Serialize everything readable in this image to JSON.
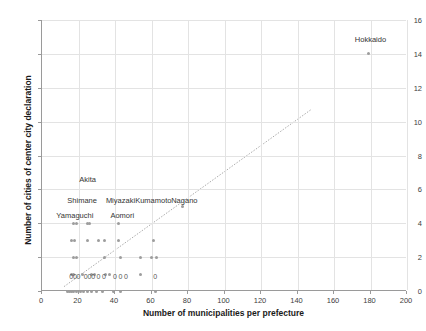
{
  "chart_data": {
    "type": "scatter",
    "title": "",
    "xlabel": "Number of municipalities per prefecture",
    "ylabel": "Number of cities of center city declaration",
    "xlim": [
      0,
      200
    ],
    "ylim": [
      0,
      16
    ],
    "xticks": [
      0,
      20,
      40,
      60,
      80,
      100,
      120,
      140,
      160,
      180,
      200
    ],
    "yticks": [
      0,
      2,
      4,
      6,
      8,
      10,
      12,
      14,
      16
    ],
    "grid": true,
    "legend": "none",
    "colors": {
      "marker": "#9d9d9d",
      "grid": "#e3e3e3",
      "axis": "#9a9a9a",
      "trendline": "#aaaaaa",
      "text": "#333333"
    },
    "trendline": {
      "type": "linear",
      "x_start": 12,
      "y_start": 0.2,
      "x_end": 148,
      "y_end": 10.7
    },
    "annotations": [
      {
        "text": "Hokkaido",
        "x": 180,
        "y": 14.9
      },
      {
        "text": "Akita",
        "x": 25,
        "y": 6.6
      },
      {
        "text": "Shimane",
        "x": 22,
        "y": 5.4
      },
      {
        "text": "Miyazaki",
        "x": 43,
        "y": 5.4
      },
      {
        "text": "Kumamoto",
        "x": 61,
        "y": 5.4
      },
      {
        "text": "Nagano",
        "x": 78,
        "y": 5.4
      },
      {
        "text": "Yamaguchi",
        "x": 18,
        "y": 4.5
      },
      {
        "text": "Aomori",
        "x": 44,
        "y": 4.5
      }
    ],
    "value_labels": [
      {
        "text": "0",
        "x": 16,
        "y": 0.9
      },
      {
        "text": "0",
        "x": 18,
        "y": 0.9
      },
      {
        "text": "0",
        "x": 20,
        "y": 0.9
      },
      {
        "text": "0",
        "x": 24,
        "y": 0.9
      },
      {
        "text": "0",
        "x": 26,
        "y": 0.9
      },
      {
        "text": "0",
        "x": 28,
        "y": 0.9
      },
      {
        "text": "0",
        "x": 31,
        "y": 0.9
      },
      {
        "text": "0",
        "x": 34,
        "y": 0.9
      },
      {
        "text": "0",
        "x": 40,
        "y": 0.9
      },
      {
        "text": "0",
        "x": 43,
        "y": 0.9
      },
      {
        "text": "0",
        "x": 46,
        "y": 0.9
      },
      {
        "text": "0",
        "x": 62,
        "y": 0.9
      }
    ],
    "points": [
      {
        "x": 179,
        "y": 14
      },
      {
        "x": 77,
        "y": 5
      },
      {
        "x": 17,
        "y": 4
      },
      {
        "x": 19,
        "y": 4
      },
      {
        "x": 25,
        "y": 4
      },
      {
        "x": 26,
        "y": 4
      },
      {
        "x": 42,
        "y": 4
      },
      {
        "x": 16,
        "y": 3
      },
      {
        "x": 18,
        "y": 3
      },
      {
        "x": 25,
        "y": 3
      },
      {
        "x": 31,
        "y": 3
      },
      {
        "x": 34,
        "y": 3
      },
      {
        "x": 42,
        "y": 3
      },
      {
        "x": 61,
        "y": 3
      },
      {
        "x": 17,
        "y": 2
      },
      {
        "x": 19,
        "y": 2
      },
      {
        "x": 34,
        "y": 2
      },
      {
        "x": 43,
        "y": 2
      },
      {
        "x": 54,
        "y": 2
      },
      {
        "x": 60,
        "y": 2
      },
      {
        "x": 63,
        "y": 2
      },
      {
        "x": 16,
        "y": 1
      },
      {
        "x": 17,
        "y": 1
      },
      {
        "x": 22,
        "y": 1
      },
      {
        "x": 27,
        "y": 1
      },
      {
        "x": 29,
        "y": 1
      },
      {
        "x": 35,
        "y": 1
      },
      {
        "x": 37,
        "y": 1
      },
      {
        "x": 54,
        "y": 1
      },
      {
        "x": 14,
        "y": 0
      },
      {
        "x": 15,
        "y": 0
      },
      {
        "x": 16,
        "y": 0
      },
      {
        "x": 17,
        "y": 0
      },
      {
        "x": 19,
        "y": 0
      },
      {
        "x": 21,
        "y": 0
      },
      {
        "x": 23,
        "y": 0
      },
      {
        "x": 25,
        "y": 0
      },
      {
        "x": 27,
        "y": 0
      },
      {
        "x": 30,
        "y": 0
      },
      {
        "x": 33,
        "y": 0
      },
      {
        "x": 39,
        "y": 0
      },
      {
        "x": 43,
        "y": 0
      },
      {
        "x": 62,
        "y": 0
      }
    ]
  }
}
